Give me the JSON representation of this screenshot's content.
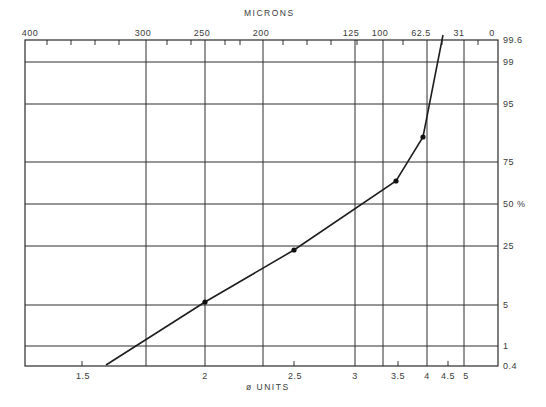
{
  "chart_data": {
    "type": "line",
    "title": "",
    "top_axis": {
      "label": "MICRONS",
      "ticks": [
        {
          "label": "400",
          "phi": 1.32
        },
        {
          "label": "300",
          "phi": 1.74
        },
        {
          "label": "250",
          "phi": 2.0
        },
        {
          "label": "200",
          "phi": 2.32
        },
        {
          "label": "125",
          "phi": 3.0
        },
        {
          "label": "100",
          "phi": 3.32
        },
        {
          "label": "62.5",
          "phi": 4.0
        },
        {
          "label": "31",
          "phi": 5.0
        },
        {
          "label": "0",
          "phi": 6.0
        }
      ]
    },
    "xlabel": "ø UNITS",
    "x_ticks": [
      "1.5",
      "2",
      "2.5",
      "3",
      "3.5",
      "4",
      "4.5",
      "5"
    ],
    "ylabel": "%",
    "y_ticks": [
      "0.4",
      "1",
      "5",
      "25",
      "50",
      "75",
      "95",
      "99",
      "99.6"
    ],
    "y_scale": "probability",
    "grid": true,
    "series": [
      {
        "name": "cumulative grain-size curve",
        "points_phi_percent": [
          {
            "phi": 1.6,
            "percent": 0.4
          },
          {
            "phi": 2.0,
            "percent": 5
          },
          {
            "phi": 2.5,
            "percent": 22
          },
          {
            "phi": 3.45,
            "percent": 60
          },
          {
            "phi": 4.0,
            "percent": 85
          },
          {
            "phi": 4.3,
            "percent": 99.6
          }
        ],
        "markers": [
          {
            "phi": 2.0,
            "percent": 5
          },
          {
            "phi": 2.5,
            "percent": 22
          },
          {
            "phi": 3.45,
            "percent": 60
          },
          {
            "phi": 4.0,
            "percent": 85
          }
        ]
      }
    ]
  },
  "pixels": {
    "frame": {
      "x1": 25,
      "y1": 40,
      "x2": 498,
      "y2": 366
    },
    "vgrid": [
      146,
      205,
      263,
      355,
      383,
      427,
      464
    ],
    "hgrid": [
      62,
      104,
      162,
      204,
      246,
      305,
      346
    ],
    "top_minor_ticks": [
      47,
      71,
      95,
      119,
      167,
      191,
      225,
      240,
      283,
      307,
      331,
      357,
      403,
      442,
      478
    ],
    "bottom_minor_ticks": [
      82,
      294,
      398,
      448
    ],
    "curve": [
      [
        106,
        365
      ],
      [
        205,
        302
      ],
      [
        294,
        250
      ],
      [
        396,
        181
      ],
      [
        423,
        137
      ],
      [
        443,
        35
      ]
    ],
    "markers": [
      [
        205,
        302
      ],
      [
        294,
        250
      ],
      [
        396,
        181
      ],
      [
        423,
        137
      ]
    ],
    "top_labels": [
      {
        "text": "400",
        "x": 30
      },
      {
        "text": "300",
        "x": 143
      },
      {
        "text": "250",
        "x": 202
      },
      {
        "text": "200",
        "x": 261
      },
      {
        "text": "125",
        "x": 351
      },
      {
        "text": "100",
        "x": 380
      },
      {
        "text": "62.5",
        "x": 421
      },
      {
        "text": "31",
        "x": 459
      },
      {
        "text": "0",
        "x": 492
      }
    ],
    "right_labels": [
      {
        "text": "99.6",
        "y": 40
      },
      {
        "text": "99",
        "y": 62
      },
      {
        "text": "95",
        "y": 104
      },
      {
        "text": "75",
        "y": 162
      },
      {
        "text": "50  %",
        "y": 204
      },
      {
        "text": "25",
        "y": 246
      },
      {
        "text": "5",
        "y": 305
      },
      {
        "text": "1",
        "y": 346
      },
      {
        "text": "0.4",
        "y": 366
      }
    ],
    "bottom_labels": [
      {
        "text": "1.5",
        "x": 83
      },
      {
        "text": "2",
        "x": 205
      },
      {
        "text": "2.5",
        "x": 295
      },
      {
        "text": "3",
        "x": 355
      },
      {
        "text": "3.5",
        "x": 398
      },
      {
        "text": "4",
        "x": 427
      },
      {
        "text": "4.5",
        "x": 448
      },
      {
        "text": "5",
        "x": 466
      }
    ]
  },
  "labels": {
    "top_axis_title": "MICRONS",
    "bottom_axis_title": "ø UNITS"
  }
}
